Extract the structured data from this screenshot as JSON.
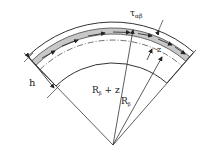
{
  "diagram": {
    "title": "",
    "labels": {
      "shear_stress": "τ",
      "shear_stress_sub": "αβ",
      "thickness": "h",
      "offset": "z",
      "radius_z": "R",
      "radius_z_sub": "β",
      "radius_z_suffix": " + z",
      "radius": "R",
      "radius_sub": "β"
    },
    "colors": {
      "line": "#333333",
      "band_fill": "#c8c8c8",
      "background": "#ffffff"
    }
  }
}
